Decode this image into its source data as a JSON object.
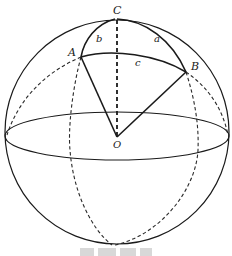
{
  "figure": {
    "type": "spherical-triangle-diagram",
    "points": {
      "A": {
        "label": "A",
        "x": 81,
        "y": 57
      },
      "B": {
        "label": "B",
        "x": 186,
        "y": 72
      },
      "C": {
        "label": "C",
        "x": 117,
        "y": 19
      },
      "O": {
        "label": "O",
        "x": 117,
        "y": 137
      }
    },
    "arcs": {
      "a": {
        "label": "a",
        "from": "C",
        "to": "B"
      },
      "b": {
        "label": "b",
        "from": "A",
        "to": "C"
      },
      "c": {
        "label": "c",
        "from": "A",
        "to": "B"
      }
    },
    "sphere": {
      "cx": 117,
      "cy": 132,
      "r": 112
    },
    "equator": {
      "cx": 117,
      "cy": 136,
      "rx": 112,
      "ry": 24
    },
    "caption_truncated": true
  }
}
